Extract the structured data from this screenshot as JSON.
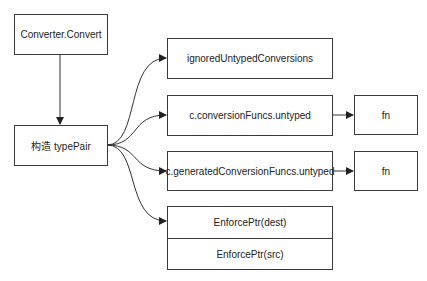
{
  "diagram": {
    "nodes": {
      "converter": "Converter.Convert",
      "typepair": "构造 typePair",
      "ignored": "ignoredUntypedConversions",
      "conversion_funcs": "c.conversionFuncs.untyped",
      "generated_funcs": "c.generatedConversionFuncs.untyped",
      "fn1": "fn",
      "fn2": "fn",
      "enforce_dest": "EnforcePtr(dest)",
      "enforce_src": "EnforcePtr(src)"
    },
    "edges": [
      {
        "from": "Converter.Convert",
        "to": "构造 typePair"
      },
      {
        "from": "构造 typePair",
        "to": "ignoredUntypedConversions"
      },
      {
        "from": "构造 typePair",
        "to": "c.conversionFuncs.untyped"
      },
      {
        "from": "构造 typePair",
        "to": "c.generatedConversionFuncs.untyped"
      },
      {
        "from": "构造 typePair",
        "to": "EnforcePtr(dest)"
      },
      {
        "from": "c.conversionFuncs.untyped",
        "to": "fn"
      },
      {
        "from": "c.generatedConversionFuncs.untyped",
        "to": "fn"
      }
    ],
    "colors": {
      "stroke": "#3a3a3a",
      "background": "#ffffff"
    }
  }
}
